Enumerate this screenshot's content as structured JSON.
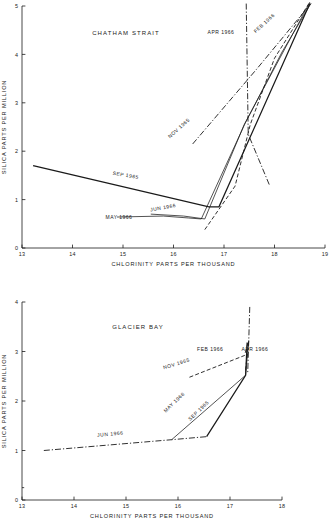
{
  "figure": {
    "background": "#ffffff",
    "ink": "#1a1a1a"
  },
  "chart_data": [
    {
      "type": "line",
      "title": "CHATHAM STRAIT",
      "xlabel": "CHLORINITY PARTS PER THOUSAND",
      "ylabel": "SILICA PARTS PER MILLION",
      "xlim": [
        13,
        19
      ],
      "ylim": [
        0,
        5
      ],
      "xticks": [
        13,
        14,
        15,
        16,
        17,
        18,
        19
      ],
      "yticks": [
        0,
        1,
        2,
        3,
        4,
        5
      ],
      "xtick_labels": [
        "13",
        "14",
        "15",
        "16",
        "17",
        "18",
        "19"
      ],
      "ytick_labels": [
        "0",
        "1",
        "2",
        "3",
        "4",
        "5"
      ],
      "grid": false,
      "legend": "inline-annotations",
      "series": [
        {
          "name": "SEP 1965",
          "style": "solid",
          "label_x": 15.05,
          "label_y": 1.47,
          "label_rotation": 9.5,
          "points": [
            {
              "x": 13.22,
              "y": 1.7
            },
            {
              "x": 16.7,
              "y": 0.85
            },
            {
              "x": 16.9,
              "y": 0.85
            },
            {
              "x": 18.7,
              "y": 5.05
            }
          ]
        },
        {
          "name": "MAY 1966",
          "style": "thin-solid",
          "label_x": 14.92,
          "label_y": 0.6,
          "label_rotation": 0,
          "points": [
            {
              "x": 14.88,
              "y": 0.64
            },
            {
              "x": 15.8,
              "y": 0.66
            },
            {
              "x": 16.3,
              "y": 0.62
            },
            {
              "x": 16.55,
              "y": 0.6
            },
            {
              "x": 17.42,
              "y": 2.58
            },
            {
              "x": 18.15,
              "y": 4.05
            },
            {
              "x": 18.72,
              "y": 5.05
            }
          ]
        },
        {
          "name": "JUN 1966",
          "style": "thin-solid",
          "label_x": 15.8,
          "label_y": 0.8,
          "label_rotation": -10,
          "points": [
            {
              "x": 15.55,
              "y": 0.7
            },
            {
              "x": 16.2,
              "y": 0.66
            },
            {
              "x": 16.62,
              "y": 0.6
            },
            {
              "x": 17.4,
              "y": 2.55
            },
            {
              "x": 18.7,
              "y": 5.08
            }
          ]
        },
        {
          "name": "NOV 1965",
          "style": "dash-dot",
          "label_x": 16.13,
          "label_y": 2.45,
          "label_rotation": -42,
          "points": [
            {
              "x": 16.38,
              "y": 2.15
            },
            {
              "x": 17.65,
              "y": 3.7
            },
            {
              "x": 18.72,
              "y": 5.05
            }
          ]
        },
        {
          "name": "APR 1966",
          "style": "dash-dot",
          "label_x": 16.94,
          "label_y": 4.42,
          "label_rotation": 0,
          "points": [
            {
              "x": 17.44,
              "y": 5.05
            },
            {
              "x": 17.48,
              "y": 2.35
            },
            {
              "x": 17.9,
              "y": 1.3
            }
          ]
        },
        {
          "name": "FEB 1966",
          "style": "dashed",
          "label_x": 17.82,
          "label_y": 4.62,
          "label_rotation": -42,
          "points": [
            {
              "x": 16.62,
              "y": 0.38
            },
            {
              "x": 17.22,
              "y": 1.28
            },
            {
              "x": 17.52,
              "y": 2.55
            },
            {
              "x": 18.0,
              "y": 3.92
            },
            {
              "x": 18.68,
              "y": 5.05
            }
          ]
        }
      ]
    },
    {
      "type": "line",
      "title": "GLACIER BAY",
      "xlabel": "CHLORINITY PARTS PER THOUSAND",
      "ylabel": "SILICA PARTS PER MILLION",
      "xlim": [
        13,
        18
      ],
      "ylim": [
        0,
        4
      ],
      "xticks": [
        13,
        14,
        15,
        16,
        17,
        18
      ],
      "yticks": [
        0,
        1,
        2,
        3,
        4
      ],
      "xtick_labels": [
        "13",
        "14",
        "15",
        "16",
        "17",
        "18"
      ],
      "ytick_labels": [
        "0",
        "1",
        "2",
        "3",
        "4"
      ],
      "grid": false,
      "legend": "inline-annotations",
      "series": [
        {
          "name": "JUN 1966",
          "style": "dash-dot",
          "label_x": 14.7,
          "label_y": 1.3,
          "label_rotation": -5,
          "points": [
            {
              "x": 13.42,
              "y": 1.0
            },
            {
              "x": 15.9,
              "y": 1.22
            },
            {
              "x": 16.55,
              "y": 1.28
            }
          ]
        },
        {
          "name": "MAY 1966",
          "style": "thin-solid",
          "label_x": 15.95,
          "label_y": 1.95,
          "label_rotation": -44,
          "points": [
            {
              "x": 15.88,
              "y": 1.22
            },
            {
              "x": 17.3,
              "y": 2.52
            },
            {
              "x": 17.36,
              "y": 3.22
            }
          ]
        },
        {
          "name": "SEP 1965",
          "style": "solid",
          "label_x": 16.42,
          "label_y": 1.78,
          "label_rotation": -44,
          "points": [
            {
              "x": 16.55,
              "y": 1.28
            },
            {
              "x": 17.3,
              "y": 2.52
            },
            {
              "x": 17.33,
              "y": 3.18
            }
          ]
        },
        {
          "name": "NOV 1965",
          "style": "dashed",
          "label_x": 15.98,
          "label_y": 2.72,
          "label_rotation": -17,
          "points": [
            {
              "x": 16.22,
              "y": 2.48
            },
            {
              "x": 17.28,
              "y": 2.92
            },
            {
              "x": 17.35,
              "y": 3.2
            }
          ]
        },
        {
          "name": "FEB 1966",
          "style": "dashed",
          "label_x": 16.62,
          "label_y": 3.02,
          "label_rotation": 0,
          "points": [
            {
              "x": 17.3,
              "y": 2.62
            },
            {
              "x": 17.36,
              "y": 3.22
            }
          ]
        },
        {
          "name": "APR 1966",
          "style": "dash-dot",
          "label_x": 17.48,
          "label_y": 3.02,
          "label_rotation": 0,
          "points": [
            {
              "x": 17.38,
              "y": 3.9
            },
            {
              "x": 17.36,
              "y": 3.2
            },
            {
              "x": 17.34,
              "y": 2.55
            }
          ]
        }
      ]
    }
  ]
}
